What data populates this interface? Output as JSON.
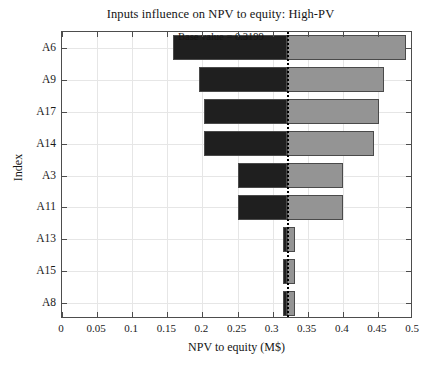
{
  "chart_data": {
    "type": "bar",
    "title": "Inputs influence on NPV to equity: High-PV",
    "xlabel": "NPV to equity (M$)",
    "ylabel": "Index",
    "xlim": [
      0,
      0.5
    ],
    "xticks": [
      0,
      0.05,
      0.1,
      0.15,
      0.2,
      0.25,
      0.3,
      0.35,
      0.4,
      0.45,
      0.5
    ],
    "xticklabels": [
      "0",
      "0.05",
      "0.1",
      "0.15",
      "0.2",
      "0.25",
      "0.3",
      "0.35",
      "0.4",
      "0.45",
      "0.5"
    ],
    "grid": true,
    "legend": "none",
    "orientation": "horizontal",
    "base_value": 0.3199,
    "base_value_label": "Base value = 0.3199",
    "categories": [
      "A6",
      "A9",
      "A17",
      "A14",
      "A3",
      "A11",
      "A13",
      "A15",
      "A8"
    ],
    "series": [
      {
        "name": "Low",
        "color": "#1f1f1f",
        "values": [
          0.158,
          0.195,
          0.202,
          0.202,
          0.251,
          0.251,
          0.3155,
          0.3155,
          0.3155
        ]
      },
      {
        "name": "High",
        "color": "#949494",
        "values": [
          0.49,
          0.459,
          0.452,
          0.445,
          0.4,
          0.4,
          0.3325,
          0.3325,
          0.3325
        ]
      }
    ],
    "bars": [
      {
        "index": "A6",
        "low": 0.158,
        "high": 0.49,
        "span": 0.332
      },
      {
        "index": "A9",
        "low": 0.195,
        "high": 0.459,
        "span": 0.264
      },
      {
        "index": "A17",
        "low": 0.202,
        "high": 0.452,
        "span": 0.25
      },
      {
        "index": "A14",
        "low": 0.202,
        "high": 0.445,
        "span": 0.243
      },
      {
        "index": "A3",
        "low": 0.251,
        "high": 0.4,
        "span": 0.149
      },
      {
        "index": "A11",
        "low": 0.251,
        "high": 0.4,
        "span": 0.149
      },
      {
        "index": "A13",
        "low": 0.3155,
        "high": 0.3325,
        "span": 0.017
      },
      {
        "index": "A15",
        "low": 0.3155,
        "high": 0.3325,
        "span": 0.017
      },
      {
        "index": "A8",
        "low": 0.3155,
        "high": 0.3325,
        "span": 0.017
      }
    ]
  },
  "colors": {
    "low_bar": "#1f1f1f",
    "high_bar": "#949494",
    "axis": "#4d4d4d",
    "grid": "#e6e6e6",
    "base_line": "#000000",
    "background": "#ffffff"
  }
}
